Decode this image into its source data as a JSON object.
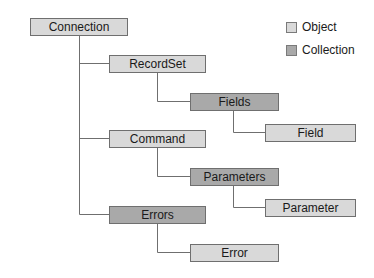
{
  "diagram": {
    "colors": {
      "object": "#d9d9d9",
      "collection": "#a9a9a9",
      "line": "#6f6f6f"
    },
    "nodes": [
      {
        "id": "connection",
        "label": "Connection",
        "type": "object"
      },
      {
        "id": "recordset",
        "label": "RecordSet",
        "type": "object"
      },
      {
        "id": "fields",
        "label": "Fields",
        "type": "collection"
      },
      {
        "id": "field",
        "label": "Field",
        "type": "object"
      },
      {
        "id": "command",
        "label": "Command",
        "type": "object"
      },
      {
        "id": "parameters",
        "label": "Parameters",
        "type": "collection"
      },
      {
        "id": "parameter",
        "label": "Parameter",
        "type": "object"
      },
      {
        "id": "errors",
        "label": "Errors",
        "type": "collection"
      },
      {
        "id": "error",
        "label": "Error",
        "type": "object"
      }
    ],
    "edges": [
      [
        "connection",
        "recordset"
      ],
      [
        "recordset",
        "fields"
      ],
      [
        "fields",
        "field"
      ],
      [
        "connection",
        "command"
      ],
      [
        "command",
        "parameters"
      ],
      [
        "parameters",
        "parameter"
      ],
      [
        "connection",
        "errors"
      ],
      [
        "errors",
        "error"
      ]
    ]
  },
  "legend": {
    "object_label": "Object",
    "collection_label": "Collection"
  }
}
